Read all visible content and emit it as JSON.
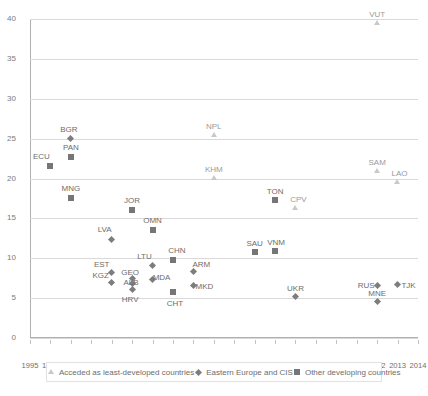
{
  "chart_data": {
    "type": "scatter",
    "title": "",
    "xlabel": "",
    "ylabel": "",
    "xlim": [
      1995,
      2014
    ],
    "ylim": [
      0,
      40
    ],
    "yticks": [
      0,
      5,
      10,
      15,
      20,
      25,
      30,
      35,
      40
    ],
    "xticks": [
      1995,
      1996,
      1997,
      1998,
      1999,
      2000,
      2001,
      2002,
      2003,
      2004,
      2005,
      2006,
      2007,
      2008,
      2009,
      2010,
      2011,
      2012,
      2013,
      2014
    ],
    "grid": "horizontal",
    "legend_position": "bottom",
    "series": [
      {
        "name": "Acceded as least-developed countries",
        "marker": "triangle",
        "color": "#c9c9c9",
        "points": [
          {
            "label": "NPL",
            "x": 2004,
            "y": 25.5
          },
          {
            "label": "KHM",
            "x": 2004,
            "y": 20.1
          },
          {
            "label": "VUT",
            "x": 2012,
            "y": 39.5
          },
          {
            "label": "SAM",
            "x": 2012,
            "y": 21.0
          },
          {
            "label": "LAO",
            "x": 2013,
            "y": 19.6
          },
          {
            "label": "CPV",
            "x": 2008,
            "y": 16.3
          }
        ]
      },
      {
        "name": "Eastern Europe and CIS",
        "marker": "diamond",
        "color": "#7d7d7d",
        "points": [
          {
            "label": "BGR",
            "x": 1997,
            "y": 25.0
          },
          {
            "label": "LVA",
            "x": 1999,
            "y": 12.4
          },
          {
            "label": "KGZ",
            "x": 1999,
            "y": 7.0
          },
          {
            "label": "EST",
            "x": 1999,
            "y": 8.2
          },
          {
            "label": "GEO",
            "x": 2000,
            "y": 7.4
          },
          {
            "label": "ALB",
            "x": 2000,
            "y": 6.8
          },
          {
            "label": "HRV",
            "x": 2000,
            "y": 6.1
          },
          {
            "label": "LTU",
            "x": 2001,
            "y": 9.1
          },
          {
            "label": "MDA",
            "x": 2001,
            "y": 7.3
          },
          {
            "label": "ARM",
            "x": 2003,
            "y": 8.3
          },
          {
            "label": "MKD",
            "x": 2003,
            "y": 6.6
          },
          {
            "label": "UKR",
            "x": 2008,
            "y": 5.2
          },
          {
            "label": "RUS",
            "x": 2012,
            "y": 6.6
          },
          {
            "label": "TJK",
            "x": 2013,
            "y": 6.7
          },
          {
            "label": "MNE",
            "x": 2012,
            "y": 4.6
          }
        ]
      },
      {
        "name": "Other developing countries",
        "marker": "square",
        "color": "#767676",
        "points": [
          {
            "label": "ECU",
            "x": 1996,
            "y": 21.6
          },
          {
            "label": "PAN",
            "x": 1997,
            "y": 22.7
          },
          {
            "label": "MNG",
            "x": 1997,
            "y": 17.6
          },
          {
            "label": "JOR",
            "x": 2000,
            "y": 16.1
          },
          {
            "label": "OMN",
            "x": 2001,
            "y": 13.6
          },
          {
            "label": "CHN",
            "x": 2002,
            "y": 9.8
          },
          {
            "label": "CHT",
            "x": 2002,
            "y": 5.8
          },
          {
            "label": "SAU",
            "x": 2006,
            "y": 10.8
          },
          {
            "label": "VNM",
            "x": 2007,
            "y": 10.9
          },
          {
            "label": "TON",
            "x": 2007,
            "y": 17.3
          }
        ]
      }
    ]
  },
  "legend": {
    "items": [
      {
        "label": "Acceded as least-developed countries",
        "marker": "triangle-icon"
      },
      {
        "label": "Eastern Europe and CIS",
        "marker": "diamond-icon"
      },
      {
        "label": "Other developing countries",
        "marker": "square-icon"
      }
    ]
  },
  "colors": {
    "grid": "#d9d9d9",
    "axis": "#b0b0b0",
    "text": "#6d6d6d",
    "ldc": "#c9c9c9",
    "cis": "#7d7d7d",
    "other": "#767676"
  }
}
